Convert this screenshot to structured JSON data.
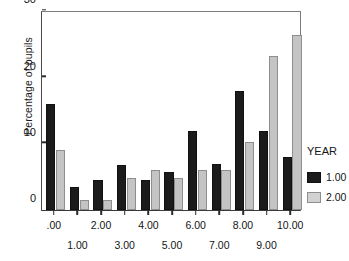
{
  "chart_data": {
    "type": "bar",
    "title": "",
    "xlabel": "",
    "ylabel": "Percentage of pupils",
    "ylim": [
      0,
      30
    ],
    "yticks": [
      0,
      10,
      20,
      30
    ],
    "ytick_labels": [
      "0",
      "10",
      "20",
      "30"
    ],
    "grid": false,
    "categories": [
      ".00",
      "1.00",
      "2.00",
      "3.00",
      "4.00",
      "5.00",
      "6.00",
      "7.00",
      "8.00",
      "9.00",
      "10.00"
    ],
    "legend": {
      "title": "YEAR",
      "position": "right",
      "entries": [
        {
          "name": "1.00",
          "color": "#1b1b1b"
        },
        {
          "name": "2.00",
          "color": "#c4c4c4"
        }
      ]
    },
    "series": [
      {
        "name": "1.00",
        "color": "#1b1b1b",
        "values": [
          16.0,
          3.5,
          4.5,
          6.8,
          4.6,
          5.8,
          12.0,
          6.9,
          18.0,
          12.0,
          8.0
        ]
      },
      {
        "name": "2.00",
        "color": "#c4c4c4",
        "values": [
          9.0,
          1.5,
          1.5,
          4.8,
          6.0,
          4.8,
          6.0,
          6.0,
          10.2,
          23.2,
          26.5
        ]
      }
    ]
  },
  "axis": {
    "y_label": "Percentage of pupils"
  }
}
